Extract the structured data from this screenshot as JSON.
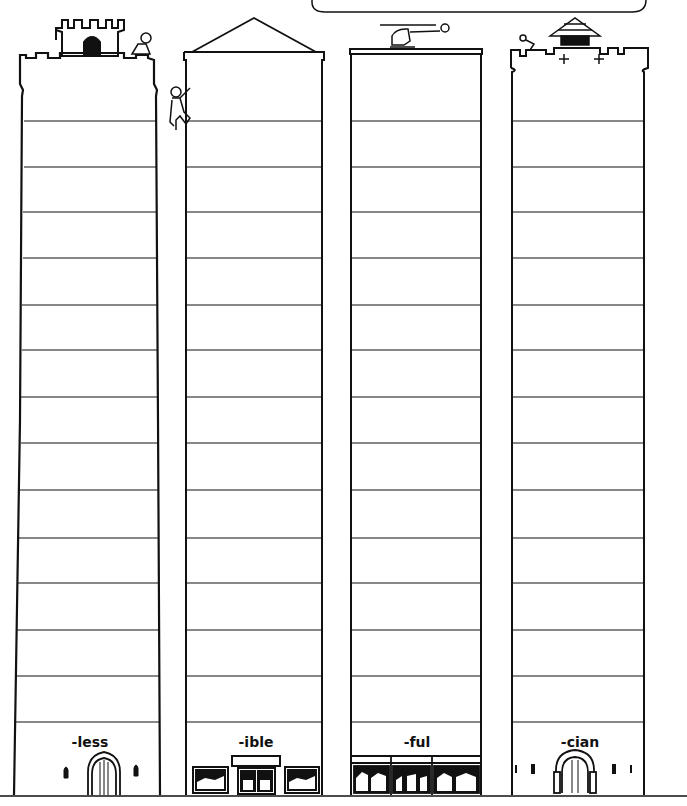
{
  "title_box": {
    "text": ""
  },
  "buildings": [
    {
      "id": "tower",
      "suffix": "-less",
      "label_x": 30,
      "roof": "castle-turret",
      "ground": "arched-door"
    },
    {
      "id": "office",
      "suffix": "-ible",
      "label_x": 196,
      "roof": "gable",
      "ground": "shopfront"
    },
    {
      "id": "skyscraper",
      "suffix": "-ful",
      "label_x": 357,
      "roof": "helipad",
      "ground": "storefront-windows"
    },
    {
      "id": "castle",
      "suffix": "-cian",
      "label_x": 520,
      "roof": "battlement-pagoda",
      "ground": "arched-door"
    }
  ],
  "floors": {
    "count": 14,
    "lines_y": [
      121,
      167,
      212,
      258,
      305,
      350,
      397,
      443,
      490,
      538,
      583,
      630,
      676,
      722
    ]
  },
  "colors": {
    "ink": "#111111",
    "background": "#ffffff"
  }
}
